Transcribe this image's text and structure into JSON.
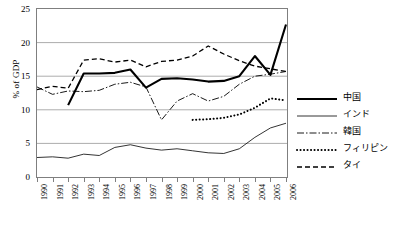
{
  "chart_data": {
    "type": "line",
    "title": "",
    "xlabel": "",
    "ylabel": "% of GDP",
    "ylim": [
      0,
      25
    ],
    "yticks": [
      0,
      5,
      10,
      15,
      20,
      25
    ],
    "grid": "horizontal",
    "legend_position": "right",
    "categories": [
      "1990",
      "1991",
      "1992",
      "1993",
      "1994",
      "1995",
      "1996",
      "1997",
      "1998",
      "1999",
      "2000",
      "2001",
      "2002",
      "2003",
      "2004",
      "2005",
      "2006"
    ],
    "series": [
      {
        "name": "中国",
        "style": "solid-thick",
        "color": "#000000",
        "values": [
          null,
          null,
          10.7,
          15.4,
          15.4,
          15.5,
          16.0,
          13.3,
          14.6,
          14.7,
          14.5,
          14.2,
          14.3,
          15.0,
          18.0,
          15.2,
          22.7
        ]
      },
      {
        "name": "インド",
        "style": "solid-thin",
        "color": "#000000",
        "values": [
          2.9,
          3.0,
          2.8,
          3.4,
          3.2,
          4.4,
          4.8,
          4.3,
          4.0,
          4.2,
          3.9,
          3.6,
          3.5,
          4.2,
          5.9,
          7.3,
          8.0
        ]
      },
      {
        "name": "韓国",
        "style": "dashdot",
        "color": "#000000",
        "values": [
          13.4,
          12.3,
          12.8,
          12.7,
          12.9,
          13.8,
          14.1,
          13.4,
          8.5,
          11.3,
          12.4,
          11.3,
          12.0,
          13.8,
          15.0,
          15.3,
          15.7
        ]
      },
      {
        "name": "フィリピン",
        "style": "dotted",
        "color": "#000000",
        "values": [
          null,
          null,
          null,
          null,
          null,
          null,
          null,
          null,
          null,
          null,
          8.5,
          8.6,
          8.8,
          9.3,
          10.3,
          11.7,
          11.4
        ]
      },
      {
        "name": "タイ",
        "style": "dashed",
        "color": "#000000",
        "values": [
          13.0,
          13.5,
          13.2,
          17.4,
          17.6,
          17.1,
          17.4,
          16.4,
          17.2,
          17.4,
          18.0,
          19.5,
          18.3,
          17.3,
          16.5,
          16.1,
          15.7
        ]
      }
    ]
  }
}
